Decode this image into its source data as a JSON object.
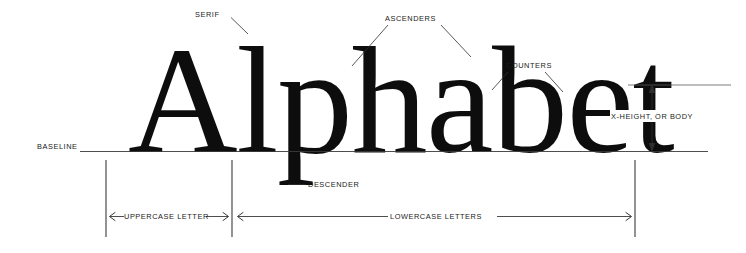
{
  "diagram": {
    "specimen_word": "Alphabet",
    "background_color": "#ffffff",
    "ink_color": "#0d0d0d",
    "rule_color": "#3a3a3a",
    "labels": {
      "serif": "SERIF",
      "ascenders": "ASCENDERS",
      "counters": "COUNTERS",
      "x_height": "X-HEIGHT, OR BODY",
      "baseline": "BASELINE",
      "descender": "DESCENDER",
      "uppercase_letter": "UPPERCASE LETTER",
      "lowercase_letters": "LOWERCASE LETTERS"
    }
  }
}
